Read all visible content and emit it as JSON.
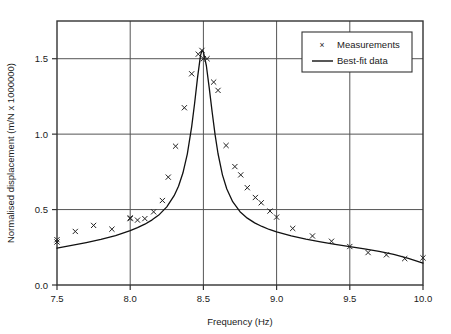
{
  "chart_data": {
    "type": "scatter",
    "title": "",
    "xlabel": "Frequency (Hz)",
    "ylabel": "Normalised displacement (m/N x 1000000)",
    "xlim": [
      7.5,
      10.0
    ],
    "ylim": [
      0.0,
      1.75
    ],
    "xticks": [
      "7.5",
      "8.0",
      "8.5",
      "9.0",
      "9.5",
      "10.0"
    ],
    "xtick_values": [
      7.5,
      8.0,
      8.5,
      9.0,
      9.5,
      10.0
    ],
    "yticks": [
      "0.0",
      "0.5",
      "1.0",
      "1.5"
    ],
    "ytick_values": [
      0.0,
      0.5,
      1.0,
      1.5
    ],
    "grid": true,
    "grid_color": "#555555",
    "frame_color": "#333333",
    "legend_position": "top-right",
    "legend": [
      {
        "name": "Measurements",
        "marker": "x",
        "color": "#222222"
      },
      {
        "name": "Best-fit data",
        "marker": "line",
        "color": "#111111"
      }
    ],
    "series": [
      {
        "name": "Measurements",
        "type": "scatter",
        "marker": "x",
        "color": "#222222",
        "points": [
          [
            7.5,
            0.3
          ],
          [
            7.5,
            0.285
          ],
          [
            7.625,
            0.355
          ],
          [
            7.75,
            0.395
          ],
          [
            7.875,
            0.37
          ],
          [
            8.0,
            0.445
          ],
          [
            8.0,
            0.44
          ],
          [
            8.05,
            0.43
          ],
          [
            8.1,
            0.44
          ],
          [
            8.16,
            0.485
          ],
          [
            8.22,
            0.56
          ],
          [
            8.26,
            0.715
          ],
          [
            8.31,
            0.92
          ],
          [
            8.37,
            1.175
          ],
          [
            8.42,
            1.4
          ],
          [
            8.465,
            1.53
          ],
          [
            8.49,
            1.555
          ],
          [
            8.5,
            1.5
          ],
          [
            8.525,
            1.5
          ],
          [
            8.57,
            1.345
          ],
          [
            8.6,
            1.29
          ],
          [
            8.655,
            0.925
          ],
          [
            8.715,
            0.785
          ],
          [
            8.755,
            0.73
          ],
          [
            8.8,
            0.645
          ],
          [
            8.855,
            0.58
          ],
          [
            8.895,
            0.545
          ],
          [
            8.955,
            0.49
          ],
          [
            9.0,
            0.45
          ],
          [
            9.11,
            0.375
          ],
          [
            9.245,
            0.325
          ],
          [
            9.375,
            0.29
          ],
          [
            9.5,
            0.255
          ],
          [
            9.625,
            0.215
          ],
          [
            9.75,
            0.2
          ],
          [
            9.875,
            0.175
          ],
          [
            10.0,
            0.18
          ]
        ]
      },
      {
        "name": "Best-fit data",
        "type": "line",
        "color": "#111111",
        "resonance_frequency": 8.49,
        "peak_amplitude": 1.555,
        "baseline_left": 0.245,
        "baseline_right": 0.145,
        "points": [
          [
            7.5,
            0.245
          ],
          [
            7.6,
            0.262
          ],
          [
            7.7,
            0.281
          ],
          [
            7.8,
            0.302
          ],
          [
            7.9,
            0.328
          ],
          [
            8.0,
            0.36
          ],
          [
            8.05,
            0.38
          ],
          [
            8.1,
            0.403
          ],
          [
            8.15,
            0.432
          ],
          [
            8.2,
            0.468
          ],
          [
            8.25,
            0.518
          ],
          [
            8.3,
            0.592
          ],
          [
            8.33,
            0.655
          ],
          [
            8.36,
            0.742
          ],
          [
            8.39,
            0.868
          ],
          [
            8.42,
            1.05
          ],
          [
            8.44,
            1.205
          ],
          [
            8.46,
            1.375
          ],
          [
            8.48,
            1.52
          ],
          [
            8.49,
            1.555
          ],
          [
            8.5,
            1.545
          ],
          [
            8.52,
            1.455
          ],
          [
            8.54,
            1.305
          ],
          [
            8.56,
            1.145
          ],
          [
            8.58,
            0.995
          ],
          [
            8.6,
            0.87
          ],
          [
            8.63,
            0.73
          ],
          [
            8.66,
            0.636
          ],
          [
            8.7,
            0.552
          ],
          [
            8.75,
            0.486
          ],
          [
            8.8,
            0.443
          ],
          [
            8.85,
            0.412
          ],
          [
            8.9,
            0.388
          ],
          [
            8.95,
            0.368
          ],
          [
            9.0,
            0.352
          ],
          [
            9.1,
            0.325
          ],
          [
            9.2,
            0.304
          ],
          [
            9.3,
            0.286
          ],
          [
            9.4,
            0.27
          ],
          [
            9.5,
            0.255
          ],
          [
            9.6,
            0.24
          ],
          [
            9.7,
            0.223
          ],
          [
            9.8,
            0.203
          ],
          [
            9.9,
            0.177
          ],
          [
            10.0,
            0.145
          ]
        ]
      }
    ]
  }
}
